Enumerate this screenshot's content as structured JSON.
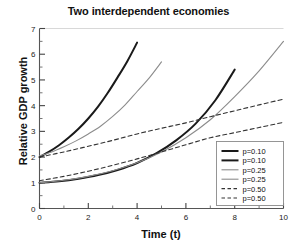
{
  "chart_data": {
    "type": "line",
    "title": "Two interdependent economies",
    "xlabel": "Time (t)",
    "ylabel": "Relative GDP growth",
    "xlim": [
      0,
      10
    ],
    "ylim": [
      0,
      7
    ],
    "xticks": [
      0,
      2,
      4,
      6,
      8,
      10
    ],
    "xticklabels": [
      "0",
      "2",
      "4",
      "6",
      "8",
      "10"
    ],
    "xminorticks": [
      1,
      3,
      5,
      7,
      9
    ],
    "yticks": [
      0,
      1,
      2,
      3,
      4,
      5,
      6,
      7
    ],
    "yticklabels": [
      "0",
      "1",
      "2",
      "3",
      "4",
      "5",
      "6",
      "7"
    ],
    "yminorticks": [
      0.5,
      1.5,
      2.5,
      3.5,
      4.5,
      5.5,
      6.5
    ],
    "grid": false,
    "legend_position": "lower right",
    "series": [
      {
        "name": "p=0.10",
        "label": "p=0.10",
        "style": "solid",
        "width": 2.0,
        "color": "#1a1a1a",
        "x": [
          0.0,
          0.4,
          0.8,
          1.2,
          1.6,
          2.0,
          2.4,
          2.8,
          3.2,
          3.6,
          4.0
        ],
        "y": [
          2.0,
          2.21,
          2.46,
          2.76,
          3.1,
          3.5,
          3.96,
          4.5,
          5.1,
          5.73,
          6.45
        ]
      },
      {
        "name": "p=0.10",
        "label": "p=0.10",
        "style": "solid",
        "width": 2.0,
        "color": "#1a1a1a",
        "x": [
          0.0,
          0.8,
          1.6,
          2.4,
          3.2,
          4.0,
          4.8,
          5.6,
          6.4,
          7.2,
          8.0
        ],
        "y": [
          1.0,
          1.06,
          1.16,
          1.3,
          1.5,
          1.77,
          2.15,
          2.65,
          3.3,
          4.2,
          5.4
        ]
      },
      {
        "name": "p=0.25",
        "label": "p=0.25",
        "style": "solid",
        "width": 1.1,
        "color": "#8c8c8c",
        "x": [
          0.0,
          0.5,
          1.0,
          1.5,
          2.0,
          2.5,
          3.0,
          3.5,
          4.0,
          4.5,
          5.0
        ],
        "y": [
          2.05,
          2.2,
          2.4,
          2.63,
          2.9,
          3.2,
          3.58,
          4.02,
          4.55,
          5.08,
          5.7
        ]
      },
      {
        "name": "p=0.25",
        "label": "p=0.25",
        "style": "solid",
        "width": 1.1,
        "color": "#8c8c8c",
        "x": [
          0.0,
          1.0,
          2.0,
          3.0,
          4.0,
          5.0,
          6.0,
          7.0,
          8.0,
          9.0,
          10.0
        ],
        "y": [
          1.0,
          1.1,
          1.25,
          1.47,
          1.78,
          2.2,
          2.75,
          3.45,
          4.35,
          5.35,
          6.5
        ]
      },
      {
        "name": "p=0.50",
        "label": "p=0.50",
        "style": "dashed",
        "width": 1.1,
        "color": "#333333",
        "x": [
          0.0,
          1.0,
          2.0,
          3.0,
          4.0,
          5.0,
          6.0,
          7.0,
          8.0,
          9.0,
          10.0
        ],
        "y": [
          2.0,
          2.2,
          2.42,
          2.65,
          2.9,
          3.12,
          3.33,
          3.57,
          3.8,
          4.03,
          4.25
        ]
      },
      {
        "name": "p=0.50",
        "label": "p=0.50",
        "style": "dashed",
        "width": 1.1,
        "color": "#333333",
        "x": [
          0.0,
          1.0,
          2.0,
          3.0,
          4.0,
          5.0,
          6.0,
          7.0,
          8.0,
          9.0,
          10.0
        ],
        "y": [
          1.08,
          1.25,
          1.45,
          1.68,
          1.93,
          2.2,
          2.48,
          2.75,
          2.95,
          3.15,
          3.35
        ]
      }
    ]
  },
  "legend": {
    "entries": [
      {
        "label": "p=0.10"
      },
      {
        "label": "p=0.10"
      },
      {
        "label": "p=0.25"
      },
      {
        "label": "p=0.25"
      },
      {
        "label": "p=0.50"
      },
      {
        "label": "p=0.50"
      }
    ]
  }
}
